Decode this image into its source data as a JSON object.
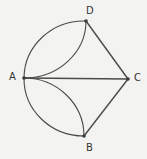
{
  "diagram": {
    "type": "geometry",
    "colors": {
      "background": "#f3f3f1",
      "stroke": "#4a4a4a",
      "text": "#333333"
    },
    "points": [
      {
        "name": "A",
        "x": 24,
        "y": 78,
        "label": "A",
        "label_x": 9,
        "label_y": 72
      },
      {
        "name": "B",
        "x": 84,
        "y": 136,
        "label": "B",
        "label_x": 86,
        "label_y": 143
      },
      {
        "name": "C",
        "x": 128,
        "y": 79,
        "label": "C",
        "label_x": 134,
        "label_y": 73
      },
      {
        "name": "D",
        "x": 86,
        "y": 21,
        "label": "D",
        "label_x": 86,
        "label_y": 6
      }
    ],
    "segments": [
      {
        "from": "A",
        "to": "C"
      },
      {
        "from": "C",
        "to": "D"
      },
      {
        "from": "C",
        "to": "B"
      }
    ],
    "arcs": [
      {
        "name": "outer-semicircle",
        "from": "D",
        "to": "B",
        "through": "A"
      },
      {
        "name": "inner-arc-AD",
        "from": "A",
        "to": "D"
      },
      {
        "name": "inner-arc-AB",
        "from": "A",
        "to": "B"
      }
    ]
  }
}
